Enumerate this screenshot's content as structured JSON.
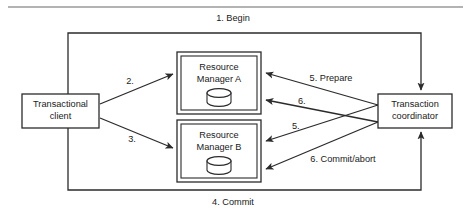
{
  "figure": {
    "type": "diagram",
    "subtype": "distributed-transaction-two-phase-commit-flow",
    "background_color": "#ffffff",
    "line_color": "#2b2b2b",
    "text_color": "#1a1a1a",
    "rule_color": "#9a9a9a"
  },
  "nodes": {
    "client": {
      "line1": "Transactional",
      "line2": "client",
      "shape": "rectangle"
    },
    "rm_a": {
      "line1": "Resource",
      "line2": "Manager A",
      "shape": "double-rectangle",
      "icon": "database-cylinder-icon"
    },
    "rm_b": {
      "line1": "Resource",
      "line2": "Manager B",
      "shape": "double-rectangle",
      "icon": "database-cylinder-icon"
    },
    "coordinator": {
      "line1": "Transaction",
      "line2": "coordinator",
      "shape": "rectangle"
    }
  },
  "edges": {
    "begin": "1. Begin",
    "client_to_rma": "2.",
    "client_to_rmb": "3.",
    "commit": "4. Commit",
    "prepare": "5. Prepare",
    "prepare_b": "5.",
    "vote_a": "6.",
    "commit_abort": "6. Commit/abort"
  }
}
